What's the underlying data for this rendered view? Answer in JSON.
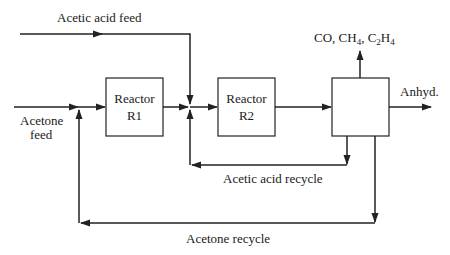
{
  "diagram": {
    "type": "process-flow",
    "streams": {
      "acetic_acid_feed": "Acetic acid feed",
      "acetone_feed_line1": "Acetone",
      "acetone_feed_line2": "feed",
      "offgas_co": "CO, CH",
      "offgas_ch4_sub": "4",
      "offgas_sep": ", C",
      "offgas_c2_sub": "2",
      "offgas_h": "H",
      "offgas_h4_sub": "4",
      "product": "Anhyd.",
      "acetic_acid_recycle": "Acetic acid recycle",
      "acetone_recycle": "Acetone recycle"
    },
    "units": {
      "r1_line1": "Reactor",
      "r1_line2": "R1",
      "r2_line1": "Reactor",
      "r2_line2": "R2",
      "separator": ""
    },
    "colors": {
      "line": "#222222",
      "text": "#1a1a1a",
      "background": "#ffffff"
    }
  }
}
